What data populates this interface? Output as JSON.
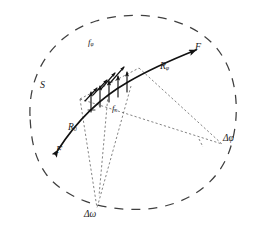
{
  "figure": {
    "name": "crack-surface-force-diagram",
    "width": 257,
    "height": 238,
    "background_color": "#ffffff",
    "stroke_color": "#1a1a1a",
    "dash_color": "#4a4a4a"
  },
  "labels": {
    "region": {
      "text": "S",
      "sub": "",
      "x": 42,
      "y": 86
    },
    "force_tangential": {
      "text": "f",
      "sub": "φ",
      "x": 90,
      "y": 42
    },
    "force_normal": {
      "text": "f",
      "sub": "n",
      "x": 113,
      "y": 107
    },
    "radius_phi": {
      "text": "R",
      "sub": "φ",
      "x": 162,
      "y": 66
    },
    "radius_zero": {
      "text": "R",
      "sub": "0",
      "x": 70,
      "y": 126
    },
    "force_upper": {
      "text": "F",
      "sub": "",
      "x": 196,
      "y": 45
    },
    "force_lower": {
      "text": "F",
      "sub": "",
      "x": 57,
      "y": 148
    },
    "delta_phi": {
      "text": "Δφ",
      "sub": "",
      "x": 224,
      "y": 137
    },
    "delta_omega": {
      "text": "Δω",
      "sub": "",
      "x": 85,
      "y": 213
    }
  },
  "elements": {
    "boundary": "dashed-closed-blob-outline",
    "main_curve": "solid-arc-with-arrowheads-both-ends",
    "normal_arrows_count": 5,
    "tangential_arrows_count": 4,
    "construction_lines": "dashed-radii-to-two-apex-points",
    "apex_phi": {
      "x": 222,
      "y": 144
    },
    "apex_omega": {
      "x": 97,
      "y": 208
    }
  }
}
